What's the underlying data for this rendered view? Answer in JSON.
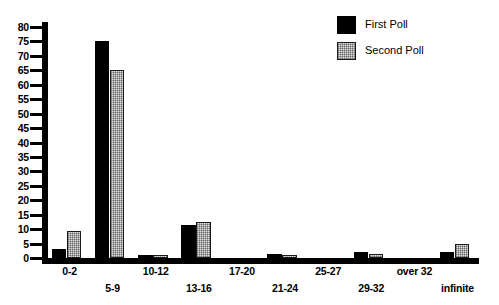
{
  "chart_data": {
    "type": "bar",
    "title": "",
    "xlabel": "",
    "ylabel": "",
    "ylim": [
      0,
      82
    ],
    "yticks": [
      0,
      5,
      10,
      15,
      20,
      25,
      30,
      35,
      40,
      45,
      50,
      55,
      60,
      65,
      70,
      75,
      80
    ],
    "grid": false,
    "legend_position": "top-right",
    "categories": [
      "0-2",
      "5-9",
      "10-12",
      "13-16",
      "17-20",
      "21-24",
      "25-27",
      "29-32",
      "over 32",
      "infinite"
    ],
    "series": [
      {
        "name": "First Poll",
        "color": "#000000",
        "values": [
          3,
          75,
          1,
          11.5,
          0,
          1.5,
          0,
          2,
          0,
          2
        ]
      },
      {
        "name": "Second Poll",
        "color": "#e2e2e2",
        "values": [
          9.5,
          65,
          1,
          12.5,
          0,
          1,
          0,
          1.5,
          0,
          5
        ]
      }
    ]
  },
  "legend": {
    "items": [
      {
        "label": "First Poll",
        "swatch": "solid-black-swatch"
      },
      {
        "label": "Second Poll",
        "swatch": "stippled-gray-swatch"
      }
    ]
  },
  "axes": {
    "y_tick_labels": [
      "80",
      "75",
      "70",
      "65",
      "60",
      "55",
      "50",
      "45",
      "40",
      "35",
      "30",
      "25",
      "20",
      "15",
      "10",
      "5",
      "0"
    ],
    "x_tick_labels": [
      "0-2",
      "5-9",
      "10-12",
      "13-16",
      "17-20",
      "21-24",
      "25-27",
      "29-32",
      "over 32",
      "infinite"
    ]
  }
}
